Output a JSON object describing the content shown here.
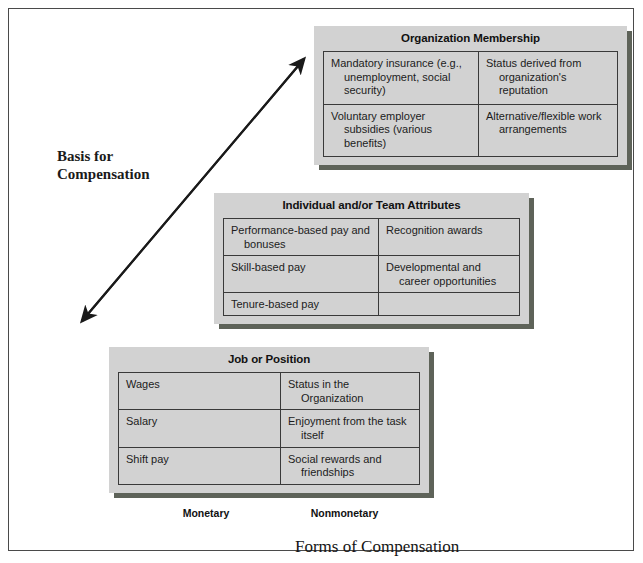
{
  "figure": {
    "vertical_axis_label": "Basis for\nCompensation",
    "caption": "Forms of Compensation",
    "column_labels": {
      "monetary": "Monetary",
      "nonmonetary": "Nonmonetary"
    },
    "arrow": "double-headed-diagonal-arrow",
    "colors": {
      "box_fill": "#d2d2d2",
      "box_shadow": "#5e6359",
      "box_border": "#3a3a3a",
      "page_border": "#4a4a4a",
      "text": "#1a1a1a"
    }
  },
  "boxes": [
    {
      "id": "organization",
      "title": "Organization Membership",
      "rows": [
        {
          "monetary": "Mandatory insurance (e.g., unemployment, social security)",
          "nonmonetary": "Status derived from organization's reputation"
        },
        {
          "monetary": "Voluntary employer subsidies (various benefits)",
          "nonmonetary": "Alternative/flexible work arrangements"
        }
      ]
    },
    {
      "id": "individual",
      "title": "Individual and/or Team Attributes",
      "rows": [
        {
          "monetary": "Performance-based pay and bonuses",
          "nonmonetary": "Recognition awards"
        },
        {
          "monetary": "Skill-based pay",
          "nonmonetary": "Developmental and career opportunities"
        },
        {
          "monetary": "Tenure-based pay",
          "nonmonetary": ""
        }
      ]
    },
    {
      "id": "job",
      "title": "Job or Position",
      "rows": [
        {
          "monetary": "Wages",
          "nonmonetary": "Status in the Organization"
        },
        {
          "monetary": "Salary",
          "nonmonetary": "Enjoyment from the task itself"
        },
        {
          "monetary": "Shift pay",
          "nonmonetary": "Social rewards and friendships"
        }
      ]
    }
  ]
}
